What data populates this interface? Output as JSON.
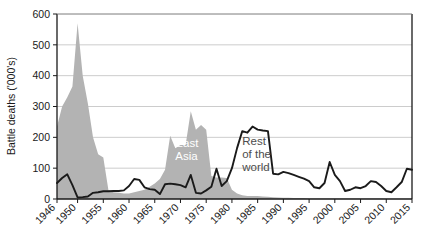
{
  "chart_data": {
    "type": "area",
    "title": "",
    "xlabel": "",
    "ylabel": "Battle deaths ('000's)",
    "ylim": [
      0,
      600
    ],
    "xlim": [
      1946,
      2015
    ],
    "grid": true,
    "legend_position": "inline-annotation",
    "ytick_labels": [
      "0",
      "100",
      "200",
      "300",
      "400",
      "500",
      "600"
    ],
    "ytick_values": [
      0,
      100,
      200,
      300,
      400,
      500,
      600
    ],
    "xtick_labels": [
      "1946",
      "1950",
      "1955",
      "1960",
      "1965",
      "1970",
      "1975",
      "1980",
      "1985",
      "1990",
      "1995",
      "2000",
      "2005",
      "2010",
      "2015"
    ],
    "xtick_values": [
      1946,
      1950,
      1955,
      1960,
      1965,
      1970,
      1975,
      1980,
      1985,
      1990,
      1995,
      2000,
      2005,
      2010,
      2015
    ],
    "annotations": [
      {
        "name": "east-asia",
        "text_lines": [
          "East",
          "Asia"
        ],
        "x": 1969,
        "y": 170,
        "color": "#ffffff"
      },
      {
        "name": "rest-of-the-world",
        "text_lines": [
          "Rest",
          "of the",
          "world"
        ],
        "x": 1982,
        "y": 175,
        "color": "#4d4d4d"
      }
    ],
    "x": [
      1946,
      1947,
      1948,
      1949,
      1950,
      1951,
      1952,
      1953,
      1954,
      1955,
      1956,
      1957,
      1958,
      1959,
      1960,
      1961,
      1962,
      1963,
      1964,
      1965,
      1966,
      1967,
      1968,
      1969,
      1970,
      1971,
      1972,
      1973,
      1974,
      1975,
      1976,
      1977,
      1978,
      1979,
      1980,
      1981,
      1982,
      1983,
      1984,
      1985,
      1986,
      1987,
      1988,
      1989,
      1990,
      1991,
      1992,
      1993,
      1994,
      1995,
      1996,
      1997,
      1998,
      1999,
      2000,
      2001,
      2002,
      2003,
      2004,
      2005,
      2006,
      2007,
      2008,
      2009,
      2010,
      2011,
      2012,
      2013,
      2014,
      2015
    ],
    "series": [
      {
        "name": "East Asia",
        "style": "filled-area",
        "color": "#b3b3b3",
        "values": [
          235,
          300,
          330,
          365,
          570,
          400,
          310,
          200,
          145,
          135,
          28,
          22,
          20,
          18,
          18,
          22,
          26,
          30,
          40,
          50,
          65,
          95,
          205,
          165,
          175,
          175,
          285,
          225,
          240,
          225,
          75,
          70,
          70,
          68,
          30,
          18,
          12,
          10,
          10,
          10,
          8,
          7,
          6,
          5,
          4,
          4,
          3,
          3,
          3,
          2,
          2,
          2,
          2,
          2,
          2,
          2,
          2,
          2,
          2,
          2,
          2,
          2,
          2,
          2,
          1,
          1,
          1,
          1,
          1,
          1
        ]
      },
      {
        "name": "Rest of the world",
        "style": "line",
        "color": "#1a1a1a",
        "values": [
          52,
          68,
          80,
          45,
          5,
          6,
          8,
          20,
          22,
          25,
          25,
          26,
          26,
          28,
          42,
          65,
          62,
          38,
          32,
          30,
          16,
          48,
          50,
          48,
          45,
          38,
          78,
          20,
          18,
          28,
          40,
          98,
          42,
          58,
          100,
          165,
          220,
          215,
          235,
          225,
          222,
          220,
          82,
          80,
          88,
          84,
          78,
          72,
          66,
          58,
          38,
          35,
          52,
          120,
          78,
          58,
          26,
          30,
          38,
          35,
          42,
          58,
          55,
          42,
          26,
          22,
          38,
          55,
          98,
          95
        ]
      }
    ]
  }
}
